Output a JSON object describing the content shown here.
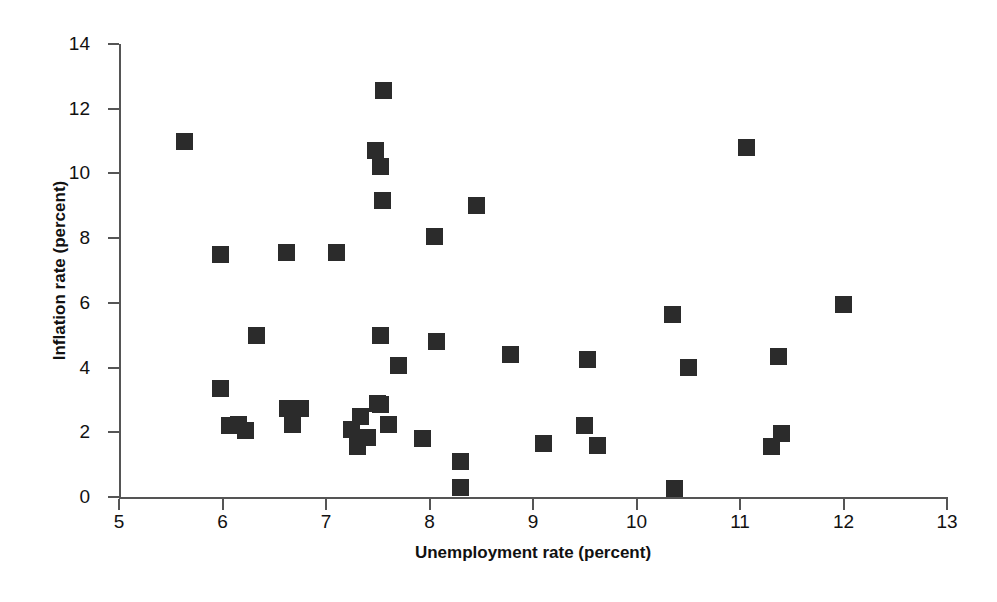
{
  "chart_data": {
    "type": "scatter",
    "title": "",
    "xlabel": "Unemployment rate (percent)",
    "ylabel": "Inflation rate (percent)",
    "xlim": [
      5,
      13
    ],
    "ylim": [
      0,
      14
    ],
    "xticks": [
      5,
      6,
      7,
      8,
      9,
      10,
      11,
      12,
      13
    ],
    "yticks": [
      0,
      2,
      4,
      6,
      8,
      10,
      12,
      14
    ],
    "xtick_labels": [
      "5",
      "6",
      "7",
      "8",
      "9",
      "10",
      "11",
      "12",
      "13"
    ],
    "ytick_labels": [
      "0",
      "2",
      "4",
      "6",
      "8",
      "10",
      "12",
      "14"
    ],
    "grid": false,
    "legend": null,
    "marker": "square",
    "marker_color": "#2b2b2b",
    "points": [
      {
        "x": 5.63,
        "y": 11.0
      },
      {
        "x": 5.98,
        "y": 7.5
      },
      {
        "x": 5.98,
        "y": 3.35
      },
      {
        "x": 6.07,
        "y": 2.2
      },
      {
        "x": 6.15,
        "y": 2.25
      },
      {
        "x": 6.22,
        "y": 2.05
      },
      {
        "x": 6.33,
        "y": 5.0
      },
      {
        "x": 6.62,
        "y": 7.55
      },
      {
        "x": 6.63,
        "y": 2.75
      },
      {
        "x": 6.68,
        "y": 2.25
      },
      {
        "x": 6.75,
        "y": 2.75
      },
      {
        "x": 7.1,
        "y": 7.55
      },
      {
        "x": 7.25,
        "y": 2.1
      },
      {
        "x": 7.3,
        "y": 1.55
      },
      {
        "x": 7.33,
        "y": 2.5
      },
      {
        "x": 7.4,
        "y": 1.85
      },
      {
        "x": 7.48,
        "y": 10.7
      },
      {
        "x": 7.5,
        "y": 2.9
      },
      {
        "x": 7.53,
        "y": 10.2
      },
      {
        "x": 7.53,
        "y": 5.0
      },
      {
        "x": 7.53,
        "y": 2.85
      },
      {
        "x": 7.55,
        "y": 9.15
      },
      {
        "x": 7.56,
        "y": 12.55
      },
      {
        "x": 7.6,
        "y": 2.25
      },
      {
        "x": 7.7,
        "y": 4.05
      },
      {
        "x": 7.93,
        "y": 1.8
      },
      {
        "x": 8.05,
        "y": 8.05
      },
      {
        "x": 8.07,
        "y": 4.8
      },
      {
        "x": 8.3,
        "y": 1.1
      },
      {
        "x": 8.3,
        "y": 0.3
      },
      {
        "x": 8.45,
        "y": 9.0
      },
      {
        "x": 8.78,
        "y": 4.4
      },
      {
        "x": 9.1,
        "y": 1.65
      },
      {
        "x": 9.5,
        "y": 2.2
      },
      {
        "x": 9.53,
        "y": 4.25
      },
      {
        "x": 9.62,
        "y": 1.6
      },
      {
        "x": 10.35,
        "y": 5.65
      },
      {
        "x": 10.37,
        "y": 0.25
      },
      {
        "x": 10.5,
        "y": 4.0
      },
      {
        "x": 11.06,
        "y": 10.8
      },
      {
        "x": 11.3,
        "y": 1.55
      },
      {
        "x": 11.37,
        "y": 4.35
      },
      {
        "x": 11.4,
        "y": 1.95
      },
      {
        "x": 12.0,
        "y": 5.95
      }
    ]
  },
  "colors": {
    "marker": "#2b2b2b",
    "axis": "#555555",
    "background": "#ffffff",
    "text": "#111111"
  }
}
